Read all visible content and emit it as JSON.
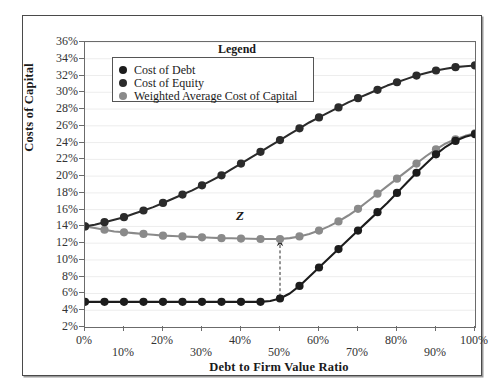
{
  "figure": {
    "y_axis_title": "Costs of Capital",
    "x_axis_title": "Debt to Firm Value Ratio",
    "annotation_label": "Z"
  },
  "legend": {
    "title": "Legend",
    "items": [
      {
        "label": "Cost of Debt",
        "color": "#1c1c1c"
      },
      {
        "label": "Cost of Equity",
        "color": "#2b2b2b"
      },
      {
        "label": "Weighted Average Cost of Capital",
        "color": "#8a8a8a"
      }
    ]
  },
  "chart_data": {
    "type": "line",
    "title": "",
    "xlabel": "Debt to Firm Value Ratio",
    "ylabel": "Costs of Capital",
    "xlim": [
      0,
      100
    ],
    "ylim": [
      2,
      36
    ],
    "grid": true,
    "legend_position": "top-center",
    "x": [
      0,
      2.5,
      5,
      7.5,
      10,
      12.5,
      15,
      17.5,
      20,
      22.5,
      25,
      27.5,
      30,
      32.5,
      35,
      37.5,
      40,
      42.5,
      45,
      47.5,
      50,
      52.5,
      55,
      57.5,
      60,
      62.5,
      65,
      67.5,
      70,
      72.5,
      75,
      77.5,
      80,
      82.5,
      85,
      87.5,
      90,
      92.5,
      95,
      97.5,
      100
    ],
    "x_ticks": [
      "0%",
      "10%",
      "20%",
      "30%",
      "40%",
      "50%",
      "60%",
      "70%",
      "80%",
      "90%",
      "100%"
    ],
    "x_tick_values": [
      0,
      10,
      20,
      30,
      40,
      50,
      60,
      70,
      80,
      90,
      100
    ],
    "y_ticks": [
      "2%",
      "4%",
      "6%",
      "8%",
      "10%",
      "12%",
      "14%",
      "16%",
      "18%",
      "20%",
      "22%",
      "24%",
      "26%",
      "28%",
      "30%",
      "32%",
      "34%",
      "36%"
    ],
    "y_tick_values": [
      2,
      4,
      6,
      8,
      10,
      12,
      14,
      16,
      18,
      20,
      22,
      24,
      26,
      28,
      30,
      32,
      34,
      36
    ],
    "series": [
      {
        "name": "Cost of Debt",
        "color": "#1c1c1c",
        "marker": "circle",
        "values": [
          5.0,
          5.0,
          5.0,
          5.0,
          5.0,
          5.0,
          5.0,
          5.0,
          5.0,
          5.0,
          5.0,
          5.0,
          5.0,
          5.0,
          5.0,
          5.0,
          5.0,
          5.0,
          5.0,
          5.1,
          5.4,
          6.0,
          6.9,
          8.0,
          9.1,
          10.2,
          11.3,
          12.4,
          13.5,
          14.6,
          15.7,
          16.8,
          18.0,
          19.2,
          20.4,
          21.5,
          22.6,
          23.5,
          24.2,
          24.7,
          25.0
        ]
      },
      {
        "name": "Cost of Equity",
        "color": "#2b2b2b",
        "marker": "circle",
        "values": [
          14.0,
          14.2,
          14.5,
          14.8,
          15.1,
          15.5,
          15.9,
          16.3,
          16.8,
          17.3,
          17.8,
          18.3,
          18.9,
          19.5,
          20.1,
          20.8,
          21.5,
          22.2,
          22.9,
          23.6,
          24.3,
          25.0,
          25.7,
          26.4,
          27.0,
          27.6,
          28.2,
          28.8,
          29.3,
          29.8,
          30.3,
          30.8,
          31.2,
          31.6,
          32.0,
          32.3,
          32.6,
          32.8,
          33.0,
          33.1,
          33.2
        ]
      },
      {
        "name": "Weighted Average Cost of Capital",
        "color": "#8a8a8a",
        "marker": "circle",
        "values": [
          14.0,
          13.8,
          13.6,
          13.4,
          13.3,
          13.2,
          13.1,
          13.0,
          12.9,
          12.85,
          12.8,
          12.75,
          12.7,
          12.65,
          12.6,
          12.58,
          12.55,
          12.52,
          12.5,
          12.5,
          12.5,
          12.6,
          12.8,
          13.1,
          13.5,
          14.0,
          14.6,
          15.3,
          16.1,
          17.0,
          17.9,
          18.8,
          19.7,
          20.6,
          21.5,
          22.4,
          23.2,
          23.9,
          24.4,
          24.8,
          25.1
        ]
      }
    ],
    "annotations": [
      {
        "label": "Z",
        "type": "double-arrow-vertical",
        "x": 50,
        "y_top": 12.5,
        "y_bottom": 5.0,
        "style": "dashed"
      }
    ]
  }
}
